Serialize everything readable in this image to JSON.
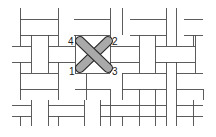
{
  "diagram": {
    "colors": {
      "background": "#ffffff",
      "line": "#4a4a4a",
      "stitch_fill": "#a9a9a9",
      "stitch_stroke": "#2a2a2a",
      "label": "#222222"
    },
    "stitch_points": [
      {
        "label": "1",
        "x": 80,
        "y": 68
      },
      {
        "label": "2",
        "x": 108,
        "y": 41
      },
      {
        "label": "3",
        "x": 108,
        "y": 68
      },
      {
        "label": "4",
        "x": 80,
        "y": 41
      }
    ],
    "labels": [
      {
        "text": "1",
        "x": 69,
        "y": 75
      },
      {
        "text": "2",
        "x": 112,
        "y": 45
      },
      {
        "text": "3",
        "x": 112,
        "y": 75
      },
      {
        "text": "4",
        "x": 68,
        "y": 45
      }
    ],
    "segments": [
      [
        20,
        8,
        20,
        35
      ],
      [
        58,
        8,
        58,
        35
      ],
      [
        20,
        19,
        58,
        19
      ],
      [
        20,
        35,
        58,
        35
      ],
      [
        74,
        19,
        110,
        19
      ],
      [
        74,
        35,
        110,
        35
      ],
      [
        110,
        8,
        110,
        35
      ],
      [
        122,
        8,
        122,
        35
      ],
      [
        130,
        19,
        166,
        19
      ],
      [
        130,
        35,
        166,
        35
      ],
      [
        166,
        8,
        166,
        35
      ],
      [
        176,
        8,
        176,
        35
      ],
      [
        184,
        19,
        203,
        19
      ],
      [
        184,
        35,
        203,
        35
      ],
      [
        31,
        35,
        31,
        73
      ],
      [
        48,
        35,
        48,
        73
      ],
      [
        12,
        46,
        31,
        46
      ],
      [
        12,
        62,
        31,
        62
      ],
      [
        48,
        46,
        75,
        46
      ],
      [
        48,
        62,
        75,
        62
      ],
      [
        20,
        35,
        20,
        46
      ],
      [
        58,
        35,
        58,
        46
      ],
      [
        20,
        62,
        20,
        73
      ],
      [
        58,
        62,
        58,
        73
      ],
      [
        75,
        35,
        75,
        73
      ],
      [
        110,
        35,
        110,
        73
      ],
      [
        110,
        46,
        139,
        46
      ],
      [
        110,
        62,
        139,
        62
      ],
      [
        139,
        35,
        139,
        73
      ],
      [
        155,
        35,
        155,
        73
      ],
      [
        155,
        46,
        195,
        46
      ],
      [
        155,
        62,
        195,
        62
      ],
      [
        166,
        35,
        166,
        46
      ],
      [
        176,
        35,
        176,
        46
      ],
      [
        166,
        62,
        166,
        73
      ],
      [
        176,
        62,
        176,
        73
      ],
      [
        195,
        35,
        195,
        73
      ],
      [
        20,
        73,
        20,
        100
      ],
      [
        58,
        73,
        58,
        100
      ],
      [
        20,
        73,
        58,
        73
      ],
      [
        20,
        89,
        58,
        89
      ],
      [
        75,
        73,
        110,
        73
      ],
      [
        75,
        89,
        110,
        89
      ],
      [
        86,
        73,
        86,
        100
      ],
      [
        122,
        73,
        122,
        100
      ],
      [
        122,
        73,
        166,
        73
      ],
      [
        122,
        89,
        166,
        89
      ],
      [
        139,
        89,
        139,
        100
      ],
      [
        155,
        89,
        155,
        100
      ],
      [
        166,
        73,
        166,
        100
      ],
      [
        176,
        73,
        176,
        100
      ],
      [
        176,
        73,
        203,
        73
      ],
      [
        176,
        89,
        203,
        89
      ],
      [
        193,
        35,
        193,
        46
      ],
      [
        31,
        100,
        31,
        126
      ],
      [
        48,
        100,
        48,
        126
      ],
      [
        12,
        105,
        31,
        105
      ],
      [
        12,
        116,
        31,
        116
      ],
      [
        48,
        105,
        84,
        105
      ],
      [
        48,
        116,
        84,
        116
      ],
      [
        84,
        100,
        84,
        126
      ],
      [
        100,
        100,
        100,
        126
      ],
      [
        100,
        105,
        155,
        105
      ],
      [
        100,
        116,
        155,
        116
      ],
      [
        110,
        89,
        110,
        126
      ],
      [
        139,
        100,
        139,
        126
      ],
      [
        155,
        100,
        155,
        126
      ],
      [
        155,
        105,
        166,
        105
      ],
      [
        155,
        116,
        166,
        116
      ],
      [
        166,
        100,
        166,
        126
      ],
      [
        176,
        100,
        176,
        126
      ],
      [
        20,
        116,
        20,
        126
      ],
      [
        58,
        116,
        58,
        126
      ],
      [
        122,
        116,
        122,
        126
      ],
      [
        193,
        100,
        193,
        126
      ],
      [
        203,
        89,
        203,
        100
      ],
      [
        176,
        105,
        203,
        105
      ],
      [
        176,
        116,
        203,
        116
      ]
    ]
  }
}
